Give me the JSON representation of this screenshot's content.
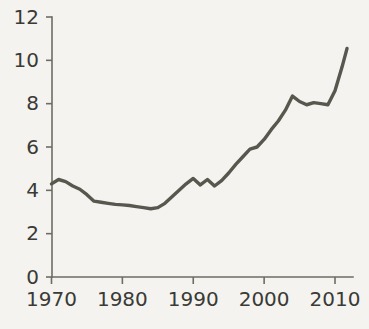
{
  "chart_data": {
    "type": "line",
    "title": "",
    "subtitle": "",
    "xlabel": "",
    "ylabel": "",
    "xlim": [
      1969.5,
      2011.8
    ],
    "ylim": [
      0,
      12
    ],
    "grid": false,
    "legend": null,
    "legend_position": "none",
    "line_color": "#57574d",
    "axis_color": "#6d6d63",
    "background_color": "#f4f3ef",
    "text_color": "#3a3a36",
    "x_ticks": [
      1970,
      1980,
      1990,
      2000,
      2010
    ],
    "x_tick_labels": [
      "1970",
      "1980",
      "1990",
      "2000",
      "2010"
    ],
    "y_ticks": [
      0,
      2,
      4,
      6,
      8,
      10,
      12
    ],
    "y_tick_labels": [
      "0",
      "2",
      "4",
      "6",
      "8",
      "10",
      "12"
    ],
    "x": [
      1970,
      1971,
      1972,
      1973,
      1974,
      1975,
      1976,
      1977,
      1978,
      1979,
      1980,
      1981,
      1982,
      1983,
      1984,
      1985,
      1986,
      1987,
      1988,
      1989,
      1990,
      1991,
      1992,
      1993,
      1994,
      1995,
      1996,
      1997,
      1998,
      1999,
      2000,
      2001,
      2002,
      2003,
      2004,
      2005,
      2006,
      2007,
      2008,
      2009,
      2010,
      2011,
      2011.7
    ],
    "values": [
      4.3,
      4.5,
      4.4,
      4.2,
      4.05,
      3.8,
      3.5,
      3.45,
      3.4,
      3.35,
      3.33,
      3.3,
      3.25,
      3.2,
      3.15,
      3.2,
      3.4,
      3.7,
      4.0,
      4.3,
      4.55,
      4.25,
      4.5,
      4.2,
      4.45,
      4.8,
      5.2,
      5.55,
      5.9,
      6.0,
      6.35,
      6.8,
      7.2,
      7.7,
      8.35,
      8.1,
      7.95,
      8.05,
      8.0,
      7.95,
      8.6,
      9.7,
      10.55
    ],
    "series": [
      {
        "name": "series-1",
        "values": [
          4.3,
          4.5,
          4.4,
          4.2,
          4.05,
          3.8,
          3.5,
          3.45,
          3.4,
          3.35,
          3.33,
          3.3,
          3.25,
          3.2,
          3.15,
          3.2,
          3.4,
          3.7,
          4.0,
          4.3,
          4.55,
          4.25,
          4.5,
          4.2,
          4.45,
          4.8,
          5.2,
          5.55,
          5.9,
          6.0,
          6.35,
          6.8,
          7.2,
          7.7,
          8.35,
          8.1,
          7.95,
          8.05,
          8.0,
          7.95,
          8.6,
          9.7,
          10.55
        ]
      }
    ]
  }
}
